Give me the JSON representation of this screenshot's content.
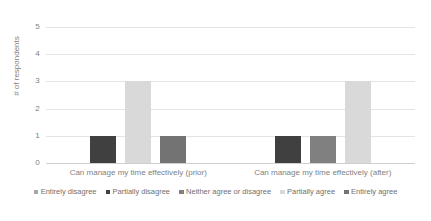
{
  "chart_data": {
    "type": "bar",
    "title": "",
    "xlabel": "",
    "ylabel": "# of respondents",
    "ylim": [
      0,
      5
    ],
    "yticks": [
      "0",
      "1",
      "2",
      "3",
      "4",
      "5"
    ],
    "grid": true,
    "legend_position": "bottom",
    "categories": [
      "Can manage my time effectively (prior)",
      "Can manage my time effectively (after)"
    ],
    "series": [
      {
        "name": "Entirely disagree",
        "color": "#a6a6a6",
        "values": [
          0,
          0
        ]
      },
      {
        "name": "Partially disagree",
        "color": "#404040",
        "values": [
          1,
          1
        ]
      },
      {
        "name": "Neither agree or disagree",
        "color": "#808080",
        "values": [
          0,
          1
        ]
      },
      {
        "name": "Partially agree",
        "color": "#d9d9d9",
        "values": [
          3,
          3
        ]
      },
      {
        "name": "Entirely agree",
        "color": "#737373",
        "values": [
          1,
          0
        ]
      }
    ]
  },
  "colors": {
    "gridline": "#e4e4e4",
    "axis_text": "#7f7f7f",
    "legend_text": "#6f6f6f",
    "background": "#ffffff"
  }
}
